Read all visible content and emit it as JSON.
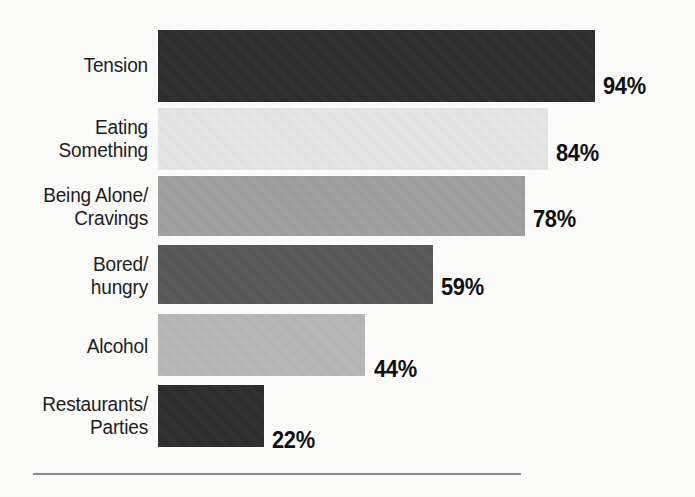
{
  "chart_data": {
    "type": "bar",
    "orientation": "horizontal",
    "title": "",
    "subtitle": "",
    "xlabel": "",
    "ylabel": "",
    "xlim": [
      0,
      100
    ],
    "grid": false,
    "legend": null,
    "value_suffix": "%",
    "categories": [
      "Tension",
      "Eating Something",
      "Being Alone/ Cravings",
      "Bored/ hungry",
      "Alcohol",
      "Restaurants/ Parties"
    ],
    "values": [
      94,
      84,
      78,
      59,
      44,
      22
    ],
    "data_labels": [
      "94%",
      "84%",
      "78%",
      "59%",
      "44%",
      "22%"
    ],
    "bar_colors": [
      "#2b2b2b",
      "#e9e9e9",
      "#a1a1a1",
      "#575757",
      "#bababa",
      "#2b2b2b"
    ]
  },
  "bars": [
    {
      "label_line1": "Tension",
      "label_line2": "",
      "value": 94,
      "value_label": "94%",
      "color": "#2b2b2b",
      "top": 30,
      "height": 72,
      "width": 437,
      "label_top": 53,
      "value_left": 603,
      "value_top": 73
    },
    {
      "label_line1": "Eating",
      "label_line2": "Something",
      "value": 84,
      "value_label": "84%",
      "color": "#e9e9e9",
      "top": 108,
      "height": 62,
      "width": 390,
      "label_top": 115,
      "value_left": 556,
      "value_top": 140
    },
    {
      "label_line1": "Being Alone/",
      "label_line2": "Cravings",
      "value": 78,
      "value_label": "78%",
      "color": "#a1a1a1",
      "top": 176,
      "height": 60,
      "width": 367,
      "label_top": 183,
      "value_left": 533,
      "value_top": 206
    },
    {
      "label_line1": "Bored/",
      "label_line2": "hungry",
      "value": 59,
      "value_label": "59%",
      "color": "#575757",
      "top": 245,
      "height": 59,
      "width": 275,
      "label_top": 252,
      "value_left": 441,
      "value_top": 274
    },
    {
      "label_line1": "Alcohol",
      "label_line2": "",
      "value": 44,
      "value_label": "44%",
      "color": "#bababa",
      "top": 314,
      "height": 62,
      "width": 207,
      "label_top": 334,
      "value_left": 374,
      "value_top": 356
    },
    {
      "label_line1": "Restaurants/",
      "label_line2": "Parties",
      "value": 22,
      "value_label": "22%",
      "color": "#2b2b2b",
      "top": 385,
      "height": 62,
      "width": 106,
      "label_top": 392,
      "value_left": 272,
      "value_top": 427
    }
  ],
  "rule": {
    "left": 33,
    "top": 473,
    "width": 488,
    "height": 2,
    "color": "#8d8d8d"
  }
}
